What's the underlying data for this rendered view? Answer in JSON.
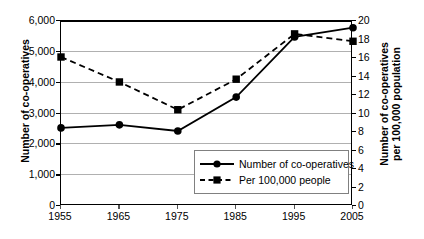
{
  "chart_data": {
    "type": "line",
    "title": "",
    "xlabel": "",
    "ylabel": "Number of co-operatives",
    "y2label": "Number of co-operatives per 100,000 population",
    "y2label_line1": "Number of co-operatives",
    "y2label_line2": "per 100,000 population",
    "categories": [
      "1955",
      "1965",
      "1975",
      "1985",
      "1995",
      "2005"
    ],
    "ylim": [
      0,
      6000
    ],
    "y2lim": [
      0,
      20
    ],
    "yticks": [
      "0",
      "1,000",
      "2,000",
      "3,000",
      "4,000",
      "5,000",
      "6,000"
    ],
    "ytick_values": [
      0,
      1000,
      2000,
      3000,
      4000,
      5000,
      6000
    ],
    "y2ticks": [
      "0",
      "2",
      "4",
      "6",
      "8",
      "10",
      "12",
      "14",
      "16",
      "18",
      "20"
    ],
    "y2tick_values": [
      0,
      2,
      4,
      6,
      8,
      10,
      12,
      14,
      16,
      18,
      20
    ],
    "grid": true,
    "legend_position": "inside-bottom-right",
    "series": [
      {
        "name": "Number of co-operatives",
        "axis": "left",
        "marker": "circle",
        "line_style": "solid",
        "color": "#000000",
        "values": [
          2500,
          2600,
          2400,
          3500,
          5450,
          5750
        ]
      },
      {
        "name": "Per 100,000 people",
        "axis": "right",
        "marker": "square",
        "line_style": "dashed",
        "color": "#000000",
        "values": [
          16.0,
          13.3,
          10.3,
          13.6,
          18.5,
          17.7
        ]
      }
    ],
    "legend": [
      {
        "label": "Number of co-operatives",
        "marker": "circle",
        "line_style": "solid"
      },
      {
        "label": "Per 100,000 people",
        "marker": "square",
        "line_style": "dashed"
      }
    ]
  }
}
